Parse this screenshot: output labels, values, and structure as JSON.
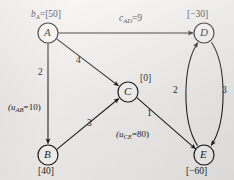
{
  "figure": {
    "type": "directed-network-flow-graph",
    "background_color": "#f2f1ef",
    "stroke_color": "#1b1b1b"
  },
  "nodes": [
    {
      "id": "A",
      "letter": "A",
      "cx": 48,
      "cy": 33,
      "r": 10,
      "annotation": "b_A=[50]",
      "supply_value": "[50]",
      "supply_prefix": "b",
      "supply_sub": "A",
      "annotation_x": 31,
      "annotation_y": 10,
      "annotation_align": "left"
    },
    {
      "id": "B",
      "letter": "B",
      "cx": 48,
      "cy": 155,
      "r": 10,
      "annotation": "[40]",
      "supply_value": "[40]",
      "supply_prefix": "",
      "supply_sub": "",
      "annotation_x": 38,
      "annotation_y": 167,
      "annotation_align": "left"
    },
    {
      "id": "C",
      "letter": "C",
      "cx": 128,
      "cy": 92,
      "r": 10,
      "annotation": "[0]",
      "supply_value": "[0]",
      "supply_prefix": "",
      "supply_sub": "",
      "annotation_x": 140,
      "annotation_y": 75,
      "annotation_align": "left"
    },
    {
      "id": "D",
      "letter": "D",
      "cx": 204,
      "cy": 33,
      "r": 10,
      "annotation": "[-30]",
      "supply_value": "[−30]",
      "supply_prefix": "",
      "supply_sub": "",
      "annotation_x": 188,
      "annotation_y": 10,
      "annotation_align": "left"
    },
    {
      "id": "E",
      "letter": "E",
      "cx": 204,
      "cy": 155,
      "r": 10,
      "annotation": "[-60]",
      "supply_value": "[−60]",
      "supply_prefix": "",
      "supply_sub": "",
      "annotation_x": 188,
      "annotation_y": 167,
      "annotation_align": "left"
    }
  ],
  "edges": [
    {
      "id": "AD",
      "from": "A",
      "to": "D",
      "shape": "straight",
      "cost_label": "c_AD=9",
      "cost_text": "=9",
      "cost_prefix": "c",
      "cost_sub": "AD",
      "cost_x": 120,
      "cost_y": 18
    },
    {
      "id": "AB",
      "from": "A",
      "to": "B",
      "shape": "straight",
      "cost_label": "2",
      "cost_x": 40,
      "cy_hint": 72,
      "cost_y": 68,
      "capacity_label": "(u_AB=10)",
      "capacity_prefix": "(u",
      "capacity_sub": "AB",
      "capacity_text": "=10)",
      "capacity_x": 9,
      "capacity_y": 104
    },
    {
      "id": "AC",
      "from": "A",
      "to": "C",
      "shape": "straight",
      "cost_label": "4",
      "cost_x": 78,
      "cost_y": 58
    },
    {
      "id": "BC",
      "from": "B",
      "to": "C",
      "shape": "straight",
      "cost_label": "3",
      "cost_x": 89,
      "cost_y": 121
    },
    {
      "id": "CE",
      "from": "C",
      "to": "E",
      "shape": "straight",
      "cost_label": "1",
      "cost_x": 148,
      "cost_y": 111,
      "capacity_label": "(u_CE=80)",
      "capacity_prefix": "(u",
      "capacity_sub": "CE",
      "capacity_text": "=80)",
      "capacity_x": 117,
      "capacity_y": 131
    },
    {
      "id": "ED",
      "from": "E",
      "to": "D",
      "shape": "curve-left",
      "cost_label": "2",
      "cost_x": 175,
      "cost_y": 88
    },
    {
      "id": "DE",
      "from": "D",
      "to": "E",
      "shape": "curve-right",
      "cost_label": "3",
      "cost_x": 223,
      "cost_y": 88
    }
  ]
}
